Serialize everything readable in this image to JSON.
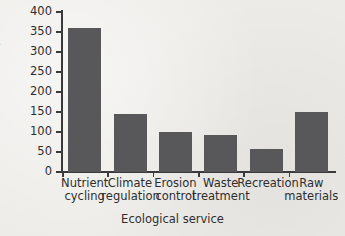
{
  "chart_data": {
    "type": "bar",
    "title": "",
    "xlabel": "Ecological service",
    "ylabel": "Worth (billions of dollars)",
    "categories": [
      "Nutrient cycling",
      "Climate regulation",
      "Erosion control",
      "Waste treatment",
      "Recreation",
      "Raw materials"
    ],
    "category_lines": [
      [
        "Nutrient",
        "cycling"
      ],
      [
        "Climate",
        "regulation"
      ],
      [
        "Erosion",
        "control"
      ],
      [
        "Waste",
        "treatment"
      ],
      [
        "Recreation",
        ""
      ],
      [
        "Raw",
        "materials"
      ]
    ],
    "values": [
      360,
      145,
      100,
      92,
      57,
      150
    ],
    "ylim": [
      0,
      400
    ],
    "yticks": [
      0,
      50,
      100,
      150,
      200,
      250,
      300,
      350,
      400
    ],
    "ytick_labels": [
      "0",
      "50",
      "100",
      "150",
      "200",
      "250",
      "300",
      "350",
      "400"
    ],
    "grid": false,
    "legend": null,
    "bar_color": "#58585a",
    "axis_color": "#3a3a3c",
    "background_color": "#ecebe7"
  }
}
